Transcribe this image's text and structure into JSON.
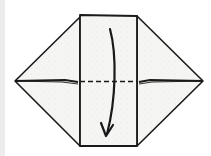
{
  "diagram": {
    "type": "origami-fold-step",
    "colors": {
      "paper": "#f4f4f2",
      "outline": "#1a1a1a",
      "background": "#ffffff",
      "edge_strip": "#ececec"
    },
    "elements": {
      "fold_line": "valley-fold-dashed-line",
      "arrow": "fold-direction-arrow-down"
    }
  }
}
